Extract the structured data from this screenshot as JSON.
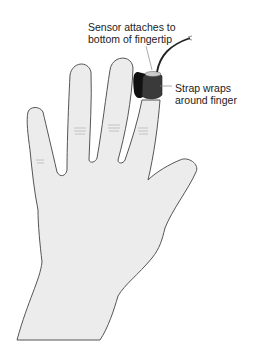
{
  "figure": {
    "colors": {
      "skin": "#ececec",
      "outline": "#555555",
      "strap": "#3a3a3a",
      "clip": "#111111",
      "cable": "#222222",
      "leader": "#888888"
    }
  },
  "labels": {
    "sensor": {
      "line1": "Sensor attaches to",
      "line2": "bottom of fingertip"
    },
    "strap": {
      "line1": "Strap wraps",
      "line2": "around finger"
    }
  }
}
